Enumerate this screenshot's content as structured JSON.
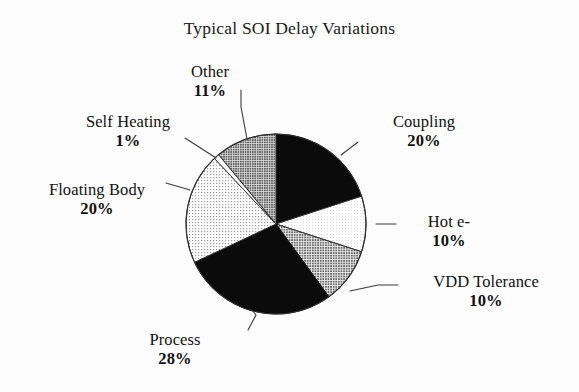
{
  "title": "Typical SOI Delay Variations",
  "chart_data": {
    "type": "pie",
    "title": "Typical SOI Delay Variations",
    "xlabel": "",
    "ylabel": "",
    "legend_position": "none",
    "labels_outside": true,
    "units": "percent",
    "total": 100,
    "start_angle_deg": 0,
    "direction": "clockwise",
    "categories": [
      "Coupling",
      "Hot e-",
      "VDD Tolerance",
      "Process",
      "Floating Body",
      "Self Heating",
      "Other"
    ],
    "values": [
      20,
      10,
      10,
      28,
      20,
      1,
      11
    ],
    "slices": [
      {
        "name": "Coupling",
        "value": 20,
        "percent_label": "20%",
        "fill": "#0b0b0b",
        "pattern": "solid-black",
        "label_side": "right"
      },
      {
        "name": "Hot e-",
        "value": 10,
        "percent_label": "10%",
        "fill": "#ededed",
        "pattern": "very-light-halftone",
        "label_side": "right"
      },
      {
        "name": "VDD Tolerance",
        "value": 10,
        "percent_label": "10%",
        "fill": "#9a9a9a",
        "pattern": "medium-halftone",
        "label_side": "right"
      },
      {
        "name": "Process",
        "value": 28,
        "percent_label": "28%",
        "fill": "#0b0b0b",
        "pattern": "solid-black",
        "label_side": "bottom-left"
      },
      {
        "name": "Floating Body",
        "value": 20,
        "percent_label": "20%",
        "fill": "#d9d9d9",
        "pattern": "light-halftone",
        "label_side": "left"
      },
      {
        "name": "Self Heating",
        "value": 1,
        "percent_label": "1%",
        "fill": "#ffffff",
        "pattern": "white-sliver",
        "label_side": "left"
      },
      {
        "name": "Other",
        "value": 11,
        "percent_label": "11%",
        "fill": "#8f8f8f",
        "pattern": "medium-dark-halftone",
        "label_side": "top-left"
      }
    ]
  },
  "labels": {
    "other": {
      "name": "Other",
      "pct": "11%"
    },
    "self_heating": {
      "name": "Self Heating",
      "pct": "1%"
    },
    "floating_body": {
      "name": "Floating Body",
      "pct": "20%"
    },
    "process": {
      "name": "Process",
      "pct": "28%"
    },
    "coupling": {
      "name": "Coupling",
      "pct": "20%"
    },
    "hot_e": {
      "name": "Hot e-",
      "pct": "10%"
    },
    "vdd_tolerance": {
      "name": "VDD Tolerance",
      "pct": "10%"
    }
  },
  "colors": {
    "background": "#fdfdfd",
    "ink": "#111111",
    "black_slice": "#0b0b0b",
    "dark_gray_slice": "#8f8f8f",
    "medium_gray_slice": "#9a9a9a",
    "light_gray_slice": "#d9d9d9",
    "pale_slice": "#ededed",
    "white_slice": "#ffffff",
    "outline": "#2a2a2a",
    "leader_line": "#3a3a3a"
  },
  "geometry": {
    "center_x": 276,
    "center_y": 224,
    "radius": 90
  }
}
